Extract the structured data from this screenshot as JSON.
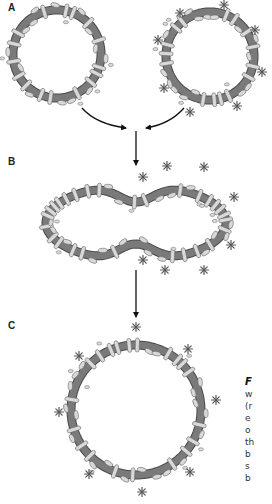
{
  "figure": {
    "panels": [
      {
        "id": "A",
        "label": "A",
        "x": 8,
        "y": 8
      },
      {
        "id": "B",
        "label": "B",
        "x": 8,
        "y": 161
      },
      {
        "id": "C",
        "label": "C",
        "x": 8,
        "y": 324
      }
    ],
    "caption_fragments": [
      "F",
      "w",
      "(r",
      "e",
      "o",
      "th",
      "b",
      "s",
      "b"
    ]
  },
  "style": {
    "membrane_color": "#7a7a7a",
    "membrane_edge": "#4a4a4a",
    "protein_fill": "#d9d9d9",
    "protein_edge": "#6a6a6a",
    "asterisk_color": "#555555",
    "arrow_color": "#111111"
  },
  "vesicles": [
    {
      "id": "A-left",
      "shape": "circle",
      "cx": 57,
      "cy": 54,
      "r": 44,
      "asterisks": false,
      "protein_count": 30
    },
    {
      "id": "A-right",
      "shape": "circle",
      "cx": 210,
      "cy": 56,
      "r": 44,
      "asterisks": true,
      "protein_count": 30,
      "asterisk_positions": [
        [
          180,
          13
        ],
        [
          224,
          5
        ],
        [
          255,
          30
        ],
        [
          158,
          40
        ],
        [
          262,
          72
        ],
        [
          164,
          88
        ],
        [
          190,
          112
        ],
        [
          237,
          106
        ]
      ]
    },
    {
      "id": "B-fused",
      "shape": "peanut",
      "cx": 136,
      "cy": 223,
      "rx": 90,
      "ry": 38,
      "waist": 0.55,
      "asterisks": true,
      "protein_count": 46,
      "asterisk_positions": [
        [
          143,
          177
        ],
        [
          167,
          166
        ],
        [
          204,
          167
        ],
        [
          234,
          197
        ],
        [
          231,
          245
        ],
        [
          143,
          260
        ],
        [
          165,
          270
        ],
        [
          204,
          270
        ]
      ]
    },
    {
      "id": "C-result",
      "shape": "circle",
      "cx": 136,
      "cy": 410,
      "r": 65,
      "asterisks": true,
      "protein_count": 40,
      "asterisk_positions": [
        [
          136,
          327
        ],
        [
          188,
          349
        ],
        [
          79,
          356
        ],
        [
          216,
          400
        ],
        [
          59,
          412
        ],
        [
          89,
          474
        ],
        [
          190,
          472
        ],
        [
          142,
          492
        ]
      ]
    }
  ],
  "arrows": [
    {
      "id": "arrow-left-curve",
      "type": "curve",
      "d": "M82 108 Q96 124 126 128",
      "head": [
        126,
        128
      ]
    },
    {
      "id": "arrow-right-curve",
      "type": "curve",
      "d": "M184 108 Q170 124 146 128",
      "head": [
        146,
        128
      ]
    },
    {
      "id": "arrow-down-1",
      "type": "line",
      "x1": 136,
      "y1": 131,
      "x2": 136,
      "y2": 165
    },
    {
      "id": "arrow-down-2",
      "type": "line",
      "x1": 136,
      "y1": 270,
      "x2": 136,
      "y2": 317
    }
  ]
}
